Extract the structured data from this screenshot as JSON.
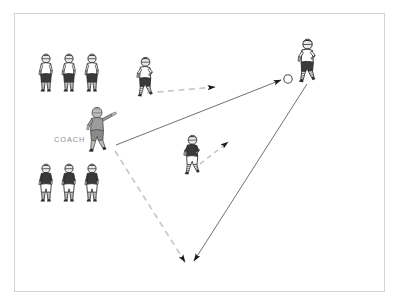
{
  "diagram": {
    "type": "sports-play-diagram",
    "sport": "soccer",
    "frame": {
      "border_color": "#d2d2d2",
      "background": "#ffffff"
    },
    "labels": [
      {
        "id": "coach",
        "text": "COACH",
        "x": 54,
        "y": 136,
        "color": "#8d8d8d"
      }
    ],
    "colors": {
      "dark_kit": "#3a3a3a",
      "light_kit": "#ffffff",
      "skin": "#bdbdbd",
      "coach_fill": "#9c9c9c",
      "outline": "#2b2b2b",
      "solid_line": "#555555",
      "dashed_line": "#c9c9c9",
      "arrow_head": "#1a1a1a",
      "ball_stroke": "#4a4a4a"
    },
    "ball": {
      "x": 288,
      "y": 79,
      "r": 4.2,
      "fill": "#ffffff",
      "stroke": "#4a4a4a"
    },
    "player_groups": [
      {
        "name": "queue-top-left",
        "kit": "light-top-dark-shorts",
        "count": 3,
        "players": [
          {
            "id": "tl-1",
            "x": 46,
            "y": 59,
            "scale": 1.0,
            "facing": "right"
          },
          {
            "id": "tl-2",
            "x": 69,
            "y": 59,
            "scale": 1.0,
            "facing": "right"
          },
          {
            "id": "tl-3",
            "x": 92,
            "y": 59,
            "scale": 1.0,
            "facing": "right"
          }
        ]
      },
      {
        "name": "queue-bottom-left",
        "kit": "dark-top-light-shorts",
        "count": 3,
        "players": [
          {
            "id": "bl-1",
            "x": 46,
            "y": 168,
            "scale": 1.0,
            "facing": "right"
          },
          {
            "id": "bl-2",
            "x": 69,
            "y": 168,
            "scale": 1.0,
            "facing": "right"
          },
          {
            "id": "bl-3",
            "x": 92,
            "y": 168,
            "scale": 1.0,
            "facing": "right"
          }
        ]
      }
    ],
    "players": [
      {
        "id": "runner-top",
        "role": "attacker",
        "kit": "light-top-dark-shorts",
        "x": 140,
        "y": 60,
        "scale": 1.05
      },
      {
        "id": "runner-middle",
        "role": "defender",
        "kit": "dark-top-light-shorts",
        "x": 185,
        "y": 140,
        "scale": 1.05
      },
      {
        "id": "server-right",
        "role": "server",
        "kit": "light-top-dark-shorts",
        "x": 298,
        "y": 38,
        "scale": 1.15
      },
      {
        "id": "coach",
        "role": "coach",
        "kit": "grey-coach",
        "x": 82,
        "y": 108,
        "scale": 1.15
      }
    ],
    "movements": [
      {
        "id": "run-top-to-ball",
        "style": "dashed",
        "color": "#c9c9c9",
        "from": {
          "x": 147,
          "y": 93
        },
        "to": {
          "x": 215,
          "y": 87
        },
        "arrow": true,
        "description": "attacker runs toward the ball"
      },
      {
        "id": "pass-coach-to-ball",
        "style": "solid",
        "color": "#555555",
        "from": {
          "x": 116,
          "y": 145
        },
        "to": {
          "x": 281,
          "y": 80
        },
        "arrow": true,
        "description": "coach serves the ball to the server"
      },
      {
        "id": "run-middle-up-right",
        "style": "dashed",
        "color": "#c9c9c9",
        "from": {
          "x": 200,
          "y": 164
        },
        "to": {
          "x": 231,
          "y": 140
        },
        "arrow": true,
        "description": "defender pressures up-field"
      },
      {
        "id": "run-coach-to-bottom",
        "style": "dashed",
        "color": "#c9c9c9",
        "from": {
          "x": 115,
          "y": 151
        },
        "to": {
          "x": 186,
          "y": 265
        },
        "arrow": true,
        "description": "player runs from coach down-field"
      },
      {
        "id": "pass-server-to-bottom",
        "style": "solid",
        "color": "#555555",
        "from": {
          "x": 307,
          "y": 84
        },
        "to": {
          "x": 194,
          "y": 264
        },
        "arrow": true,
        "description": "server plays the ball into the bottom space"
      }
    ]
  }
}
